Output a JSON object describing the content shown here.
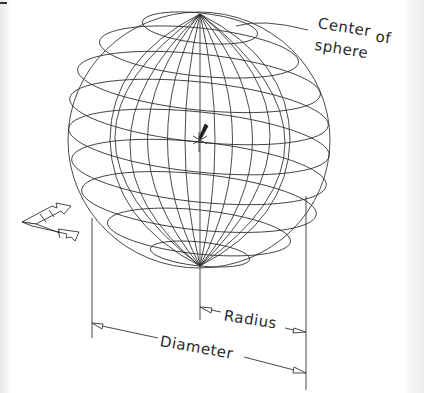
{
  "diagram": {
    "labels": {
      "center_line1": "Center",
      "center_line2": "of",
      "center_line3": "sphere",
      "radius": "Radius",
      "diameter": "Diameter"
    },
    "colors": {
      "line": "#2a2a2a",
      "background": "#ffffff"
    }
  }
}
